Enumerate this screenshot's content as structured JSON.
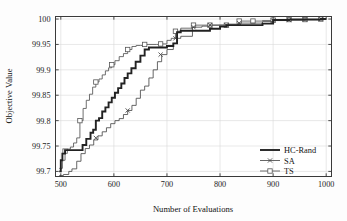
{
  "figure": {
    "background_color": "#fdfdfd",
    "axes_color": "#3a3a3a",
    "grid_color": "#d8d8d8"
  },
  "chart_data": {
    "type": "line",
    "title": "",
    "subtitle": "",
    "xlabel": "Number of Evaluations",
    "ylabel": "Objective Value",
    "xlim": [
      490,
      1010
    ],
    "ylim": [
      99.69,
      100.005
    ],
    "xticks": [
      500,
      600,
      700,
      800,
      900,
      1000
    ],
    "yticks": [
      99.7,
      99.75,
      99.8,
      99.85,
      99.9,
      99.95,
      100
    ],
    "xtick_labels": [
      "500",
      "600",
      "700",
      "800",
      "900",
      "1000"
    ],
    "ytick_labels": [
      "99.7",
      "99.75",
      "99.8",
      "99.85",
      "99.9",
      "99.95",
      "100"
    ],
    "grid": true,
    "step_style": "post",
    "legend_position": "lower right",
    "series": [
      {
        "name": "HC-Rand",
        "color": "#222222",
        "line_width": 1.9,
        "marker": "none",
        "x": [
          497,
          500,
          503,
          508,
          528,
          541,
          548,
          556,
          561,
          566,
          572,
          578,
          584,
          590,
          596,
          602,
          608,
          614,
          620,
          626,
          633,
          641,
          650,
          658,
          666,
          688,
          700,
          712,
          719,
          726,
          748,
          763,
          781,
          800,
          812,
          836,
          862,
          880,
          900,
          930,
          960,
          990,
          1000
        ],
        "y": [
          99.7,
          99.722,
          99.735,
          99.742,
          99.742,
          99.752,
          99.764,
          99.776,
          99.782,
          99.8,
          99.805,
          99.818,
          99.826,
          99.836,
          99.845,
          99.855,
          99.864,
          99.873,
          99.884,
          99.893,
          99.903,
          99.916,
          99.928,
          99.94,
          99.944,
          99.944,
          99.947,
          99.952,
          99.974,
          99.977,
          99.977,
          99.977,
          99.981,
          99.985,
          99.988,
          99.988,
          99.988,
          99.991,
          99.998,
          99.999,
          99.999,
          100.0,
          100.0
        ]
      },
      {
        "name": "SA",
        "color": "#4a4a4a",
        "line_width": 0.85,
        "marker": "x",
        "x": [
          497,
          505,
          515,
          521,
          530,
          538,
          546,
          554,
          562,
          570,
          578,
          586,
          594,
          602,
          610,
          618,
          626,
          634,
          642,
          650,
          658,
          666,
          674,
          682,
          690,
          700,
          712,
          719,
          726,
          748,
          766,
          781,
          800,
          812,
          836,
          862,
          880,
          900,
          930,
          960,
          990,
          1000
        ],
        "y": [
          99.692,
          99.694,
          99.7,
          99.705,
          99.72,
          99.735,
          99.745,
          99.752,
          99.762,
          99.77,
          99.778,
          99.786,
          99.794,
          99.8,
          99.804,
          99.812,
          99.82,
          99.83,
          99.844,
          99.86,
          99.868,
          99.884,
          99.9,
          99.916,
          99.93,
          99.94,
          99.952,
          99.962,
          99.966,
          99.984,
          99.986,
          99.988,
          99.988,
          99.988,
          99.992,
          99.992,
          99.995,
          99.997,
          99.998,
          99.999,
          100.0,
          100.0
        ],
        "marker_x": [
          566,
          626,
          688,
          716,
          750,
          781,
          812,
          836,
          900,
          930,
          960,
          990
        ],
        "marker_y": [
          99.766,
          99.82,
          99.93,
          99.962,
          99.984,
          99.988,
          99.988,
          99.992,
          99.997,
          99.998,
          99.999,
          100.0
        ]
      },
      {
        "name": "TS",
        "color": "#555555",
        "line_width": 0.85,
        "marker": "square",
        "x": [
          497,
          503,
          508,
          512,
          518,
          524,
          530,
          536,
          542,
          548,
          554,
          560,
          566,
          572,
          578,
          584,
          590,
          596,
          602,
          610,
          618,
          626,
          634,
          642,
          650,
          658,
          666,
          680,
          688,
          700,
          708,
          716,
          726,
          748,
          766,
          781,
          800,
          812,
          836,
          862,
          880,
          900,
          930,
          960,
          990,
          1000
        ],
        "y": [
          99.706,
          99.722,
          99.74,
          99.744,
          99.748,
          99.756,
          99.766,
          99.8,
          99.824,
          99.84,
          99.852,
          99.866,
          99.876,
          99.882,
          99.89,
          99.898,
          99.904,
          99.91,
          99.918,
          99.926,
          99.932,
          99.94,
          99.946,
          99.948,
          99.948,
          99.95,
          99.95,
          99.95,
          99.951,
          99.958,
          99.962,
          99.976,
          99.982,
          99.988,
          99.988,
          99.988,
          99.988,
          99.99,
          99.996,
          99.996,
          99.997,
          99.998,
          99.999,
          99.999,
          100.0,
          100.0
        ],
        "marker_x": [
          508,
          536,
          566,
          596,
          626,
          658,
          688,
          716,
          750,
          781,
          812,
          836,
          862,
          900,
          930,
          960,
          990
        ],
        "marker_y": [
          99.74,
          99.8,
          99.876,
          99.91,
          99.94,
          99.95,
          99.951,
          99.976,
          99.988,
          99.988,
          99.988,
          99.996,
          99.996,
          99.998,
          99.999,
          99.999,
          100.0
        ]
      }
    ],
    "legend": [
      {
        "label": "HC-Rand",
        "marker": "none",
        "color": "#222222"
      },
      {
        "label": "SA",
        "marker": "x",
        "color": "#4a4a4a"
      },
      {
        "label": "TS",
        "marker": "square",
        "color": "#555555"
      }
    ]
  }
}
